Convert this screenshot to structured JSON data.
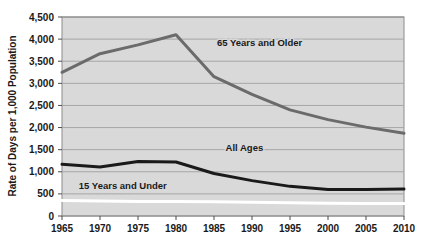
{
  "chart_data": {
    "type": "line",
    "title": "",
    "xlabel": "",
    "ylabel": "Rate of Days per 1,000 Population",
    "xlim": [
      1965,
      2010
    ],
    "ylim": [
      0,
      4500
    ],
    "grid": true,
    "legend_position": "inline-labels",
    "plot_background": "#d9d9d9",
    "x": [
      1965,
      1970,
      1975,
      1980,
      1985,
      1990,
      1995,
      2000,
      2005,
      2010
    ],
    "x_tick_labels": [
      "1965",
      "1970",
      "1975",
      "1980",
      "1985",
      "1990",
      "1995",
      "2000",
      "2005",
      "2010"
    ],
    "y_ticks": [
      0,
      500,
      1000,
      1500,
      2000,
      2500,
      3000,
      3500,
      4000,
      4500
    ],
    "y_tick_labels": [
      "0",
      "500",
      "1,000",
      "1,500",
      "2,000",
      "2,500",
      "3,000",
      "3,500",
      "4,000",
      "4,500"
    ],
    "series": [
      {
        "name": "65 Years and Older",
        "color": "#6b6b6b",
        "width": 3.0,
        "label_x": 1991,
        "label_y": 3850,
        "values": [
          3250,
          3670,
          3870,
          4100,
          3150,
          2750,
          2400,
          2180,
          2010,
          1870
        ]
      },
      {
        "name": "All Ages",
        "color": "#1a1a1a",
        "width": 3.0,
        "label_x": 1989,
        "label_y": 1480,
        "values": [
          1170,
          1110,
          1230,
          1220,
          960,
          800,
          670,
          600,
          600,
          610
        ]
      },
      {
        "name": "15 Years and Under",
        "color": "#ffffff",
        "width": 3.0,
        "label_x": 1973,
        "label_y": 620,
        "values": [
          350,
          340,
          330,
          330,
          320,
          310,
          300,
          290,
          280,
          280
        ]
      }
    ]
  },
  "axis": {
    "y_title": "Rate of Days per 1,000 Population"
  },
  "series_labels": {
    "older": "65 Years and Older",
    "all_ages": "All Ages",
    "under": "15 Years and Under"
  }
}
